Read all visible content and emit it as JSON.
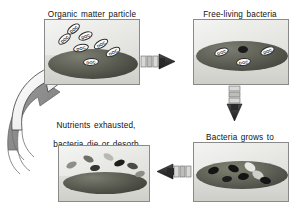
{
  "diagram": {
    "type": "cycle-diagram",
    "background": "#ffffff",
    "panels": [
      {
        "id": "panel-1",
        "caption": "Organic matter particle\nadsorbs DOC",
        "caption_line1": "Organic matter particle",
        "caption_line2": "adsorbs DOC",
        "caption_x": 36,
        "caption_y": 1,
        "caption_w": 112,
        "x": 44,
        "y": 19,
        "w": 96,
        "h": 66,
        "particle": {
          "cx": 48,
          "cy": 44,
          "rx": 45,
          "ry": 15,
          "color_top": "#6f7166",
          "color_bottom": "#3d3f38"
        },
        "doc_label": "DOC",
        "docs": [
          {
            "x": 21,
            "y": 5,
            "w": 15,
            "h": 8,
            "rot": -38
          },
          {
            "x": 12,
            "y": 15,
            "w": 15,
            "h": 8,
            "rot": -40
          },
          {
            "x": 33,
            "y": 12,
            "w": 15,
            "h": 8,
            "rot": -22
          },
          {
            "x": 28,
            "y": 24,
            "w": 16,
            "h": 8,
            "rot": -12
          },
          {
            "x": 48,
            "y": 20,
            "w": 16,
            "h": 8,
            "rot": -30
          },
          {
            "x": 60,
            "y": 28,
            "w": 16,
            "h": 8,
            "rot": -28
          },
          {
            "x": 38,
            "y": 38,
            "w": 16,
            "h": 8,
            "rot": -5
          }
        ],
        "microbes": []
      },
      {
        "id": "panel-2",
        "caption": "Free-living bacteria\nattaches to particle",
        "caption_line1": "Free-living bacteria",
        "caption_line2": "attaches to particle",
        "caption_x": 188,
        "caption_y": 1,
        "caption_w": 104,
        "x": 193,
        "y": 19,
        "w": 96,
        "h": 66,
        "particle": {
          "cx": 48,
          "cy": 36,
          "rx": 46,
          "ry": 15,
          "color_top": "#6f7166",
          "color_bottom": "#44463f"
        },
        "doc_label": "DOC",
        "docs": [
          {
            "x": 20,
            "y": 28,
            "w": 15,
            "h": 8,
            "rot": -20
          },
          {
            "x": 42,
            "y": 38,
            "w": 15,
            "h": 8,
            "rot": -8
          },
          {
            "x": 66,
            "y": 27,
            "w": 15,
            "h": 8,
            "rot": -22
          }
        ],
        "microbes": [
          {
            "x": 44,
            "y": 26,
            "w": 10,
            "h": 7,
            "rot": 0,
            "color": "#1b1b1b"
          }
        ]
      },
      {
        "id": "panel-3",
        "caption": "Bacteria grows to\nform colony",
        "caption_line1": "Bacteria grows to",
        "caption_line2": "form colony",
        "caption_x": 190,
        "caption_y": 124,
        "caption_w": 100,
        "x": 193,
        "y": 142,
        "w": 96,
        "h": 60,
        "particle": {
          "cx": 48,
          "cy": 32,
          "rx": 46,
          "ry": 14,
          "color_top": "#74766a",
          "color_bottom": "#41433c"
        },
        "doc_label": "DOC",
        "docs": [],
        "microbes": [
          {
            "x": 14,
            "y": 24,
            "w": 11,
            "h": 7,
            "rot": -18,
            "color": "#141414"
          },
          {
            "x": 34,
            "y": 22,
            "w": 11,
            "h": 7,
            "rot": 20,
            "color": "#141414"
          },
          {
            "x": 44,
            "y": 30,
            "w": 11,
            "h": 7,
            "rot": -10,
            "color": "#141414"
          },
          {
            "x": 50,
            "y": 20,
            "w": 12,
            "h": 8,
            "rot": 35,
            "color": "#e8e8e4"
          },
          {
            "x": 58,
            "y": 28,
            "w": 12,
            "h": 8,
            "rot": 28,
            "color": "#cfcfc9"
          },
          {
            "x": 66,
            "y": 34,
            "w": 11,
            "h": 7,
            "rot": 12,
            "color": "#141414"
          },
          {
            "x": 28,
            "y": 33,
            "w": 10,
            "h": 6,
            "rot": -5,
            "color": "#1d1d1d"
          }
        ]
      },
      {
        "id": "panel-4",
        "caption": "Nutrients exhausted,\nbacteria die or desorb\nfrom particle",
        "caption_line1": "Nutrients exhausted,",
        "caption_line2": "bacteria die or desorb",
        "caption_line3": "from particle",
        "caption_x": 36,
        "caption_y": 114,
        "caption_w": 120,
        "x": 58,
        "y": 145,
        "w": 92,
        "h": 57,
        "particle": {
          "cx": 46,
          "cy": 37,
          "rx": 42,
          "ry": 11,
          "color_top": "#6d6f64",
          "color_bottom": "#3a3c35"
        },
        "doc_label": "DOC",
        "docs": [],
        "microbes": [
          {
            "x": 7,
            "y": 16,
            "w": 11,
            "h": 6,
            "rot": -25,
            "color": "#8d8f86"
          },
          {
            "x": 24,
            "y": 10,
            "w": 11,
            "h": 6,
            "rot": 25,
            "color": "#6e7068"
          },
          {
            "x": 31,
            "y": 19,
            "w": 10,
            "h": 6,
            "rot": -10,
            "color": "#34352f"
          },
          {
            "x": 44,
            "y": 8,
            "w": 11,
            "h": 6,
            "rot": 30,
            "color": "#b8b9b2"
          },
          {
            "x": 55,
            "y": 14,
            "w": 11,
            "h": 6,
            "rot": -20,
            "color": "#1e1e1b"
          },
          {
            "x": 68,
            "y": 17,
            "w": 11,
            "h": 6,
            "rot": 15,
            "color": "#4a4b44"
          },
          {
            "x": 76,
            "y": 25,
            "w": 10,
            "h": 6,
            "rot": -18,
            "color": "#8d8f86"
          }
        ]
      }
    ],
    "connectors": [
      {
        "id": "connector-top",
        "name": "arrow-panel1-to-panel2",
        "direction": "right"
      },
      {
        "id": "connector-right",
        "name": "arrow-panel2-to-panel3",
        "direction": "down"
      },
      {
        "id": "connector-bottom",
        "name": "arrow-panel3-to-panel4",
        "direction": "left"
      },
      {
        "id": "connector-recycle",
        "name": "arrow-panel4-to-panel1",
        "direction": "curved-up-right"
      }
    ],
    "colors": {
      "panel_border": "#8a8a8a",
      "arrow_dark": "#2a2a2a",
      "arrow_white": "#fbfbfb",
      "arrow_gray": "#7d7d7d",
      "particle_dark": "#3d3f38",
      "text": "#111111"
    }
  }
}
